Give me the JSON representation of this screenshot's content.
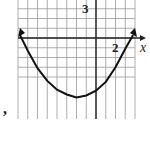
{
  "chart_data": {
    "type": "line",
    "title": "",
    "xlabel": "x",
    "ylabel": "",
    "grid": true,
    "tick_labels": {
      "x": [
        "2"
      ],
      "y": [
        "3"
      ]
    },
    "xlim": [
      -8,
      4
    ],
    "ylim": [
      -8,
      4
    ],
    "series": [
      {
        "name": "parabola",
        "x": [
          -7.8,
          -7,
          -6,
          -5,
          -4,
          -3,
          -2,
          -1,
          0,
          1,
          2,
          3,
          3.8
        ],
        "y": [
          0.3,
          -1.3,
          -3.1,
          -4.4,
          -5.3,
          -5.8,
          -6.1,
          -5.9,
          -5.4,
          -4.5,
          -3.0,
          -1.1,
          0.3
        ]
      }
    ],
    "vertex": [
      -2,
      -6.1
    ],
    "x_intercepts": [
      -7.6,
      3.6
    ]
  },
  "labels": {
    "x_axis": "x",
    "x_tick": "2",
    "y_tick": "3",
    "stray": ","
  }
}
